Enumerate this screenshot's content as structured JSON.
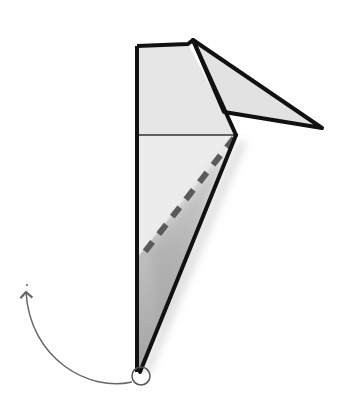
{
  "diagram": {
    "type": "origami-fold-step",
    "colors": {
      "paper": "#e4e4e4",
      "paper_front": "#ebebeb",
      "outline": "#111111",
      "crease": "#333333",
      "valley_fold_dash": "#555555",
      "shadow": "#8a8a8a",
      "arrow": "#666666",
      "pivot_circle": "#555555",
      "background": "#ffffff"
    },
    "elements": {
      "main_flap": "Tall narrow folded paper shape",
      "top_flap": "Triangular flap pointing right",
      "horizontal_crease": "Thin crease across the upper body",
      "valley_fold_line": "Dashed diagonal fold line",
      "pivot_point": "Circle marking the bottom point",
      "fold_arrow": "Curved arrow indicating fold up and to the left"
    }
  }
}
